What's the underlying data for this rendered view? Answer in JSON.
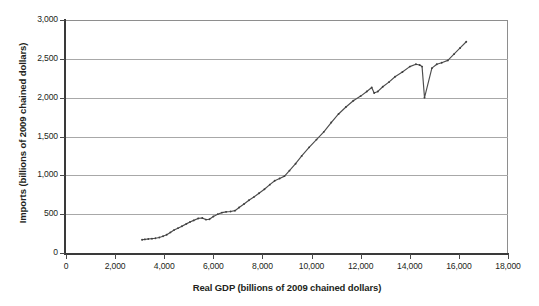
{
  "chart_data": {
    "type": "scatter",
    "title": "",
    "subtitle": "",
    "xlabel": "Real GDP (billions of 2009 chained dollars)",
    "ylabel": "Imports (billions of 2009 chained dollars)",
    "xlim": [
      0,
      18000
    ],
    "ylim": [
      0,
      3000
    ],
    "xticks": [
      0,
      2000,
      4000,
      6000,
      8000,
      10000,
      12000,
      14000,
      16000,
      18000
    ],
    "xticklabels": [
      "0",
      "2,000",
      "4,000",
      "6,000",
      "8,000",
      "10,000",
      "12,000",
      "14,000",
      "16,000",
      "18,000"
    ],
    "yticks": [
      0,
      500,
      1000,
      1500,
      2000,
      2500,
      3000
    ],
    "yticklabels": [
      "0",
      "500",
      "1,000",
      "1,500",
      "2,000",
      "2,500",
      "3,000"
    ],
    "grid": "horizontal",
    "legend": "none",
    "marker": "small-dot",
    "line_connected": true,
    "series": [
      {
        "name": "Imports vs Real GDP",
        "color": "#4d4d4d",
        "points": [
          [
            3100,
            170
          ],
          [
            3210,
            175
          ],
          [
            3350,
            180
          ],
          [
            3500,
            185
          ],
          [
            3640,
            190
          ],
          [
            3800,
            200
          ],
          [
            3950,
            215
          ],
          [
            4100,
            235
          ],
          [
            4250,
            265
          ],
          [
            4400,
            295
          ],
          [
            4560,
            320
          ],
          [
            4720,
            345
          ],
          [
            4900,
            375
          ],
          [
            5050,
            400
          ],
          [
            5200,
            420
          ],
          [
            5380,
            445
          ],
          [
            5550,
            450
          ],
          [
            5700,
            430
          ],
          [
            5840,
            435
          ],
          [
            6000,
            470
          ],
          [
            6180,
            500
          ],
          [
            6350,
            520
          ],
          [
            6520,
            530
          ],
          [
            6700,
            535
          ],
          [
            6880,
            545
          ],
          [
            7050,
            585
          ],
          [
            7250,
            630
          ],
          [
            7450,
            680
          ],
          [
            7650,
            720
          ],
          [
            7860,
            770
          ],
          [
            8080,
            820
          ],
          [
            8300,
            880
          ],
          [
            8500,
            930
          ],
          [
            8700,
            960
          ],
          [
            8900,
            990
          ],
          [
            9100,
            1060
          ],
          [
            9350,
            1150
          ],
          [
            9600,
            1250
          ],
          [
            9900,
            1360
          ],
          [
            10200,
            1460
          ],
          [
            10500,
            1560
          ],
          [
            10800,
            1680
          ],
          [
            11100,
            1790
          ],
          [
            11400,
            1880
          ],
          [
            11700,
            1960
          ],
          [
            12000,
            2020
          ],
          [
            12250,
            2080
          ],
          [
            12450,
            2130
          ],
          [
            12550,
            2060
          ],
          [
            12700,
            2080
          ],
          [
            12900,
            2140
          ],
          [
            13150,
            2200
          ],
          [
            13400,
            2270
          ],
          [
            13700,
            2330
          ],
          [
            14000,
            2400
          ],
          [
            14250,
            2430
          ],
          [
            14400,
            2420
          ],
          [
            14500,
            2400
          ],
          [
            14600,
            2000
          ],
          [
            14900,
            2380
          ],
          [
            15100,
            2430
          ],
          [
            15300,
            2450
          ],
          [
            15550,
            2480
          ],
          [
            15800,
            2560
          ],
          [
            16050,
            2640
          ],
          [
            16300,
            2720
          ]
        ]
      }
    ]
  }
}
